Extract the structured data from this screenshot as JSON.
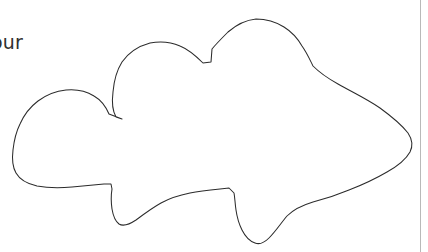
{
  "canvas": {
    "width": 428,
    "height": 252,
    "background_color": "#ffffff"
  },
  "label": {
    "text": "our",
    "note_color": "#303030"
  },
  "figure": {
    "name": "hand-drawn-closed-contour",
    "stroke_color": "#2b2b2b",
    "fill_color": "#ffffff",
    "stroke_width": 1.05,
    "bbox": {
      "x_min": 13,
      "y_min": 19,
      "x_max": 413,
      "y_max": 244
    },
    "outline_path": "M 122 119 L 116 117 C 112 110 112 100 113 92 C 114 80 117 70 122 62 C 129 52 139 46 150 43 C 160 41 171 42 180 46 C 190 50 197 57 203 63 L 211 62 L 212 49 C 216 44 222 38 228 32 C 236 25 246 20 256 19 C 266 19 276 22 284 27 C 292 32 298 39 302 46 C 307 53 310 60 313 66 C 320 73 329 79 338 84 C 352 92 367 99 380 108 C 391 116 401 124 408 133 C 412 139 413 146 410 152 C 405 161 396 167 387 172 C 375 179 362 185 349 190 C 337 195 325 199 313 202 C 303 205 294 209 287 216 C 281 223 276 231 269 238 C 265 242 260 245 255 243 C 249 241 245 236 242 230 C 239 224 237 217 236 210 C 235 204 235 198 234 193 L 229 188 L 220 189 C 210 190 200 191 190 193 C 180 195 170 198 161 203 C 152 208 144 214 136 220 C 130 224 124 227 119 224 C 115 221 113 215 112 209 C 111 202 111 195 112 189 L 111 184 L 104 184 C 94 185 83 186 72 187 C 60 188 48 188 37 186 C 28 184 20 180 16 173 C 12 166 12 158 13 150 C 14 141 16 132 20 124 C 24 115 30 107 38 101 C 46 95 56 91 66 90 C 76 89 86 91 94 96 C 101 100 106 107 109 114 L 122 119 Z",
    "outline_points_sample": [
      [
        122,
        119
      ],
      [
        113,
        92
      ],
      [
        122,
        62
      ],
      [
        150,
        43
      ],
      [
        180,
        46
      ],
      [
        203,
        63
      ],
      [
        211,
        62
      ],
      [
        212,
        49
      ],
      [
        228,
        32
      ],
      [
        256,
        19
      ],
      [
        284,
        27
      ],
      [
        302,
        46
      ],
      [
        313,
        66
      ],
      [
        338,
        84
      ],
      [
        380,
        108
      ],
      [
        408,
        133
      ],
      [
        410,
        152
      ],
      [
        387,
        172
      ],
      [
        349,
        190
      ],
      [
        313,
        202
      ],
      [
        287,
        216
      ],
      [
        269,
        238
      ],
      [
        255,
        243
      ],
      [
        242,
        230
      ],
      [
        236,
        210
      ],
      [
        234,
        193
      ],
      [
        220,
        189
      ],
      [
        190,
        193
      ],
      [
        161,
        203
      ],
      [
        136,
        220
      ],
      [
        119,
        224
      ],
      [
        112,
        209
      ],
      [
        112,
        189
      ],
      [
        104,
        184
      ],
      [
        72,
        187
      ],
      [
        37,
        186
      ],
      [
        16,
        173
      ],
      [
        13,
        150
      ],
      [
        20,
        124
      ],
      [
        38,
        101
      ],
      [
        66,
        90
      ],
      [
        94,
        96
      ],
      [
        109,
        114
      ]
    ]
  },
  "page_rule": {
    "name": "right-page-border",
    "x": 420.5,
    "y_start": 0,
    "y_end": 252,
    "color": "#b9b9b9"
  }
}
